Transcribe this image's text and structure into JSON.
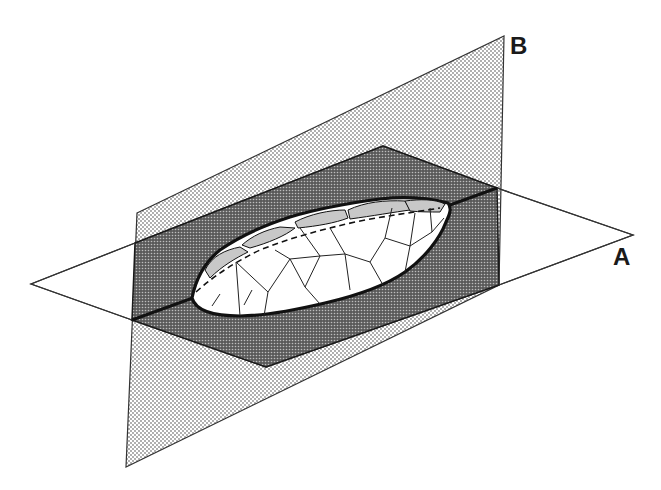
{
  "figure": {
    "labels": {
      "plane_a": "A",
      "plane_b": "B"
    },
    "colors": {
      "background": "#ffffff",
      "plane_b_fill": "#d9d9d9",
      "dark_region_fill": "#6b6b6b",
      "outline": "#1a1a1a",
      "flake_fill": "#ffffff",
      "facet_fill": "#cfcfcf"
    }
  }
}
